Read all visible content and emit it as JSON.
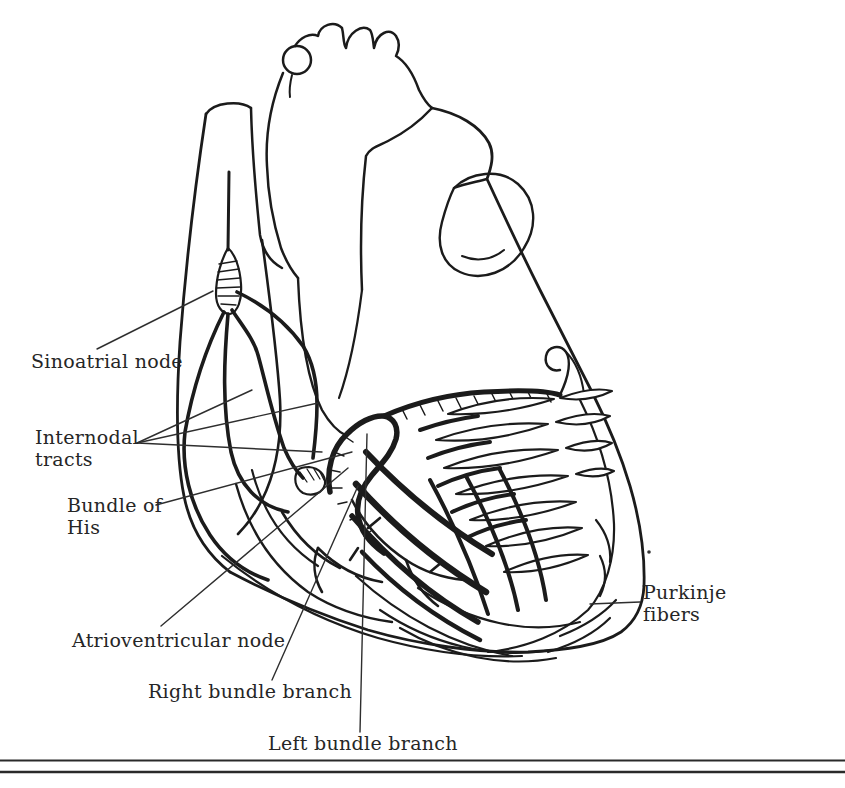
{
  "figure": {
    "type": "anatomical-line-drawing",
    "colors": {
      "ink": "#1b1b1b",
      "leader_line": "#2e2e2e",
      "text": "#262626",
      "background": "#ffffff"
    },
    "labels": {
      "sinoatrial": {
        "text": "Sinoatrial node",
        "lines": [
          "Sinoatrial node"
        ]
      },
      "internodal": {
        "text": "Internodal tracts",
        "lines": [
          "Internodal",
          "tracts"
        ]
      },
      "bundle_of_his": {
        "text": "Bundle of His",
        "lines": [
          "Bundle of",
          "His"
        ]
      },
      "atrioventricular": {
        "text": "Atrioventricular node",
        "lines": [
          "Atrioventricular node"
        ]
      },
      "right_bundle": {
        "text": "Right bundle branch",
        "lines": [
          "Right bundle branch"
        ]
      },
      "left_bundle": {
        "text": "Left bundle branch",
        "lines": [
          "Left bundle branch"
        ]
      },
      "purkinje": {
        "text": "Purkinje fibers",
        "lines": [
          "Purkinje",
          "fibers"
        ]
      }
    }
  }
}
